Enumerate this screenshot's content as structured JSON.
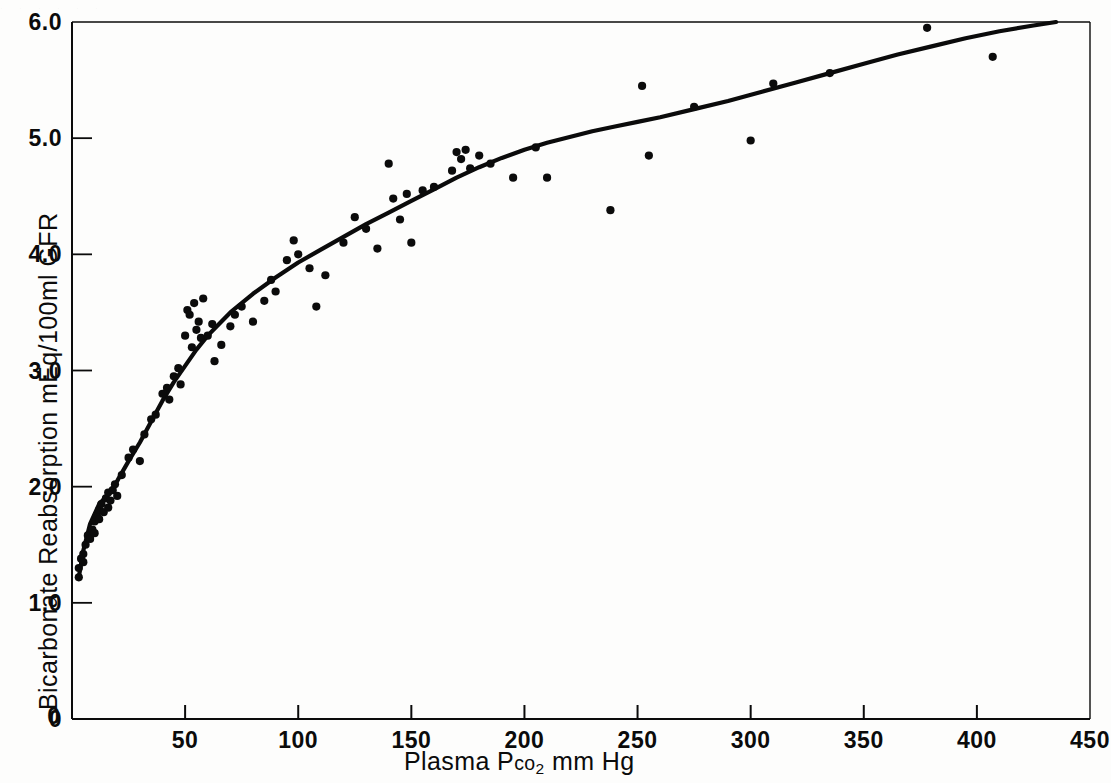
{
  "figure": {
    "scan_artifact_top": ". , .  ,  .  ,   .   ,   .   ,    .",
    "ink_color": "#0b0b0b",
    "background_color": "#fdfdfc"
  },
  "chart_data": {
    "type": "scatter",
    "title": "",
    "subtitle": "",
    "xlabel_parts": {
      "prefix": "Plasma  P",
      "smallcaps": "co",
      "subscript": "2",
      "suffix": "  mm Hg"
    },
    "xlabel": "Plasma Pco2 mm Hg",
    "ylabel": "Bicarbonate  Reabsorption  mEq/100ml GFR",
    "xlim": [
      0,
      450
    ],
    "ylim": [
      0,
      6.0
    ],
    "xticks": [
      0,
      50,
      100,
      150,
      200,
      250,
      300,
      350,
      400,
      450
    ],
    "xtick_labels": [
      "0",
      "50",
      "100",
      "150",
      "200",
      "250",
      "300",
      "350",
      "400",
      "450"
    ],
    "yticks": [
      0,
      1.0,
      2.0,
      3.0,
      4.0,
      5.0,
      6.0
    ],
    "ytick_labels": [
      "0",
      "1.0",
      "2.0",
      "3.0",
      "4.0",
      "5.0",
      "6.0"
    ],
    "grid": false,
    "legend": "none",
    "marker": "filled-circle",
    "marker_size_px": 5,
    "series": [
      {
        "name": "observed reabsorption",
        "type": "scatter",
        "points": [
          [
            3,
            1.22
          ],
          [
            3,
            1.3
          ],
          [
            4,
            1.38
          ],
          [
            5,
            1.42
          ],
          [
            5,
            1.35
          ],
          [
            6,
            1.5
          ],
          [
            7,
            1.58
          ],
          [
            8,
            1.55
          ],
          [
            9,
            1.63
          ],
          [
            10,
            1.7
          ],
          [
            10,
            1.6
          ],
          [
            11,
            1.75
          ],
          [
            12,
            1.8
          ],
          [
            12,
            1.72
          ],
          [
            13,
            1.85
          ],
          [
            14,
            1.78
          ],
          [
            15,
            1.9
          ],
          [
            16,
            1.95
          ],
          [
            16,
            1.82
          ],
          [
            17,
            1.88
          ],
          [
            18,
            1.97
          ],
          [
            19,
            2.02
          ],
          [
            20,
            1.92
          ],
          [
            22,
            2.1
          ],
          [
            25,
            2.25
          ],
          [
            27,
            2.32
          ],
          [
            30,
            2.22
          ],
          [
            32,
            2.45
          ],
          [
            35,
            2.58
          ],
          [
            37,
            2.62
          ],
          [
            40,
            2.8
          ],
          [
            42,
            2.85
          ],
          [
            43,
            2.75
          ],
          [
            45,
            2.95
          ],
          [
            47,
            3.02
          ],
          [
            48,
            2.88
          ],
          [
            50,
            3.3
          ],
          [
            51,
            3.52
          ],
          [
            52,
            3.48
          ],
          [
            53,
            3.2
          ],
          [
            54,
            3.58
          ],
          [
            55,
            3.35
          ],
          [
            56,
            3.42
          ],
          [
            57,
            3.28
          ],
          [
            58,
            3.62
          ],
          [
            60,
            3.3
          ],
          [
            62,
            3.4
          ],
          [
            63,
            3.08
          ],
          [
            66,
            3.22
          ],
          [
            70,
            3.38
          ],
          [
            72,
            3.48
          ],
          [
            75,
            3.55
          ],
          [
            80,
            3.42
          ],
          [
            85,
            3.6
          ],
          [
            88,
            3.78
          ],
          [
            90,
            3.68
          ],
          [
            95,
            3.95
          ],
          [
            98,
            4.12
          ],
          [
            100,
            4.0
          ],
          [
            105,
            3.88
          ],
          [
            108,
            3.55
          ],
          [
            112,
            3.82
          ],
          [
            120,
            4.1
          ],
          [
            125,
            4.32
          ],
          [
            130,
            4.22
          ],
          [
            135,
            4.05
          ],
          [
            140,
            4.78
          ],
          [
            142,
            4.48
          ],
          [
            145,
            4.3
          ],
          [
            148,
            4.52
          ],
          [
            150,
            4.1
          ],
          [
            155,
            4.55
          ],
          [
            160,
            4.58
          ],
          [
            168,
            4.72
          ],
          [
            170,
            4.88
          ],
          [
            172,
            4.82
          ],
          [
            174,
            4.9
          ],
          [
            176,
            4.74
          ],
          [
            180,
            4.85
          ],
          [
            185,
            4.78
          ],
          [
            195,
            4.66
          ],
          [
            205,
            4.92
          ],
          [
            210,
            4.66
          ],
          [
            238,
            4.38
          ],
          [
            252,
            5.45
          ],
          [
            255,
            4.85
          ],
          [
            275,
            5.27
          ],
          [
            300,
            4.98
          ],
          [
            310,
            5.47
          ],
          [
            335,
            5.56
          ],
          [
            378,
            5.95
          ],
          [
            407,
            5.7
          ]
        ]
      },
      {
        "name": "fitted curve",
        "type": "line",
        "points": [
          [
            3,
            1.22
          ],
          [
            5,
            1.45
          ],
          [
            8,
            1.68
          ],
          [
            12,
            1.85
          ],
          [
            16,
            1.93
          ],
          [
            20,
            2.05
          ],
          [
            25,
            2.22
          ],
          [
            30,
            2.38
          ],
          [
            35,
            2.56
          ],
          [
            40,
            2.74
          ],
          [
            45,
            2.9
          ],
          [
            50,
            3.04
          ],
          [
            55,
            3.18
          ],
          [
            60,
            3.3
          ],
          [
            65,
            3.4
          ],
          [
            70,
            3.5
          ],
          [
            75,
            3.58
          ],
          [
            80,
            3.66
          ],
          [
            90,
            3.8
          ],
          [
            100,
            3.93
          ],
          [
            110,
            4.04
          ],
          [
            120,
            4.15
          ],
          [
            130,
            4.26
          ],
          [
            140,
            4.36
          ],
          [
            150,
            4.46
          ],
          [
            160,
            4.56
          ],
          [
            170,
            4.66
          ],
          [
            180,
            4.75
          ],
          [
            190,
            4.83
          ],
          [
            200,
            4.9
          ],
          [
            210,
            4.96
          ],
          [
            220,
            5.01
          ],
          [
            230,
            5.06
          ],
          [
            240,
            5.1
          ],
          [
            250,
            5.14
          ],
          [
            260,
            5.18
          ],
          [
            275,
            5.25
          ],
          [
            290,
            5.32
          ],
          [
            305,
            5.4
          ],
          [
            320,
            5.48
          ],
          [
            335,
            5.56
          ],
          [
            350,
            5.64
          ],
          [
            365,
            5.72
          ],
          [
            380,
            5.79
          ],
          [
            395,
            5.86
          ],
          [
            410,
            5.92
          ],
          [
            425,
            5.97
          ],
          [
            435,
            6.0
          ]
        ]
      }
    ]
  }
}
